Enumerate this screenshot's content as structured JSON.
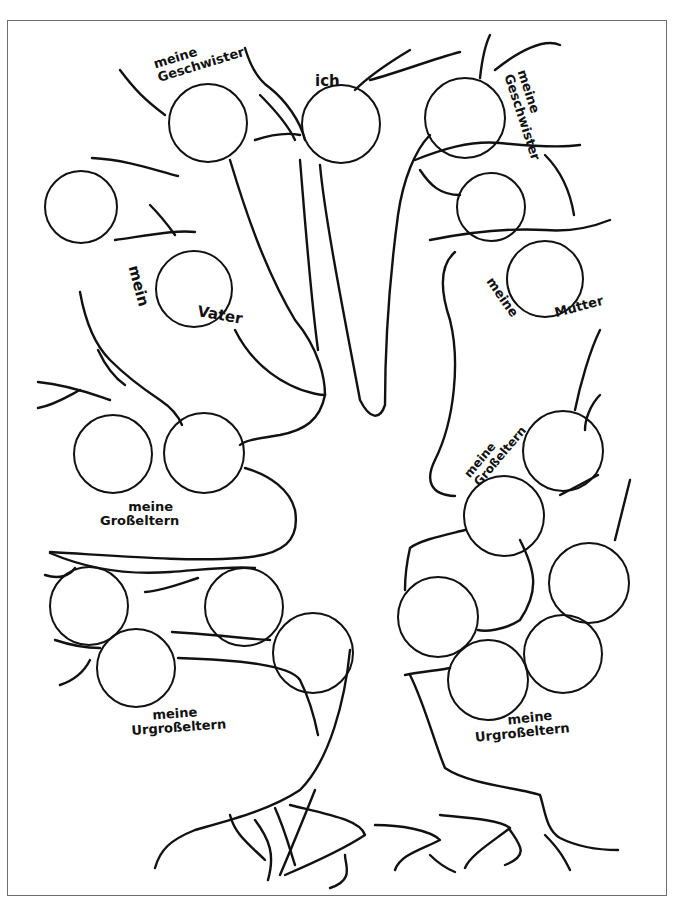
{
  "worksheet": {
    "title": "Stammbaum",
    "colors": {
      "line": "#111111",
      "frame": "#6e6e6e",
      "background": "#ffffff"
    }
  },
  "labels": {
    "siblings_left": {
      "line1": "meine",
      "line2": "Geschwister"
    },
    "me": {
      "line1": "ich"
    },
    "siblings_right": {
      "line1": "meine",
      "line2": "Geschwister"
    },
    "father": {
      "line1": "mein",
      "line2": "Vater"
    },
    "mother": {
      "line1": "meine",
      "line2": "Mutter"
    },
    "grandparents_left": {
      "line1": "meine",
      "line2": "Großeltern"
    },
    "grandparents_right": {
      "line1": "meine",
      "line2": "Großeltern"
    },
    "great_grandparents_left": {
      "line1": "meine",
      "line2": "Urgroßeltern"
    },
    "great_grandparents_right": {
      "line1": "meine",
      "line2": "Urgroßeltern"
    }
  },
  "slots": [
    {
      "id": "sibling-left-1",
      "group": "siblings_left",
      "cx": 208,
      "cy": 123,
      "r": 40
    },
    {
      "id": "sibling-left-2",
      "group": "siblings_left",
      "cx": 81,
      "cy": 207,
      "r": 37
    },
    {
      "id": "me",
      "group": "me",
      "cx": 341,
      "cy": 124,
      "r": 40
    },
    {
      "id": "sibling-right-1",
      "group": "siblings_right",
      "cx": 465,
      "cy": 118,
      "r": 41
    },
    {
      "id": "sibling-right-2",
      "group": "siblings_right",
      "cx": 491,
      "cy": 207,
      "r": 35
    },
    {
      "id": "father",
      "group": "father",
      "cx": 194,
      "cy": 289,
      "r": 39
    },
    {
      "id": "mother",
      "group": "mother",
      "cx": 545,
      "cy": 279,
      "r": 39
    },
    {
      "id": "grandparent-left-1",
      "group": "grandparents_left",
      "cx": 113,
      "cy": 454,
      "r": 40
    },
    {
      "id": "grandparent-left-2",
      "group": "grandparents_left",
      "cx": 204,
      "cy": 453,
      "r": 41
    },
    {
      "id": "grandparent-right-1",
      "group": "grandparents_right",
      "cx": 563,
      "cy": 451,
      "r": 41
    },
    {
      "id": "grandparent-right-2",
      "group": "grandparents_right",
      "cx": 504,
      "cy": 516,
      "r": 41
    },
    {
      "id": "great-grandparent-left-1",
      "group": "great_grandparents_left",
      "cx": 89,
      "cy": 606,
      "r": 40
    },
    {
      "id": "great-grandparent-left-2",
      "group": "great_grandparents_left",
      "cx": 244,
      "cy": 607,
      "r": 40
    },
    {
      "id": "great-grandparent-left-3",
      "group": "great_grandparents_left",
      "cx": 136,
      "cy": 668,
      "r": 40
    },
    {
      "id": "great-grandparent-left-4",
      "group": "great_grandparents_left",
      "cx": 313,
      "cy": 653,
      "r": 41
    },
    {
      "id": "great-grandparent-right-1",
      "group": "great_grandparents_right",
      "cx": 438,
      "cy": 617,
      "r": 41
    },
    {
      "id": "great-grandparent-right-2",
      "group": "great_grandparents_right",
      "cx": 589,
      "cy": 583,
      "r": 41
    },
    {
      "id": "great-grandparent-right-3",
      "group": "great_grandparents_right",
      "cx": 563,
      "cy": 654,
      "r": 40
    },
    {
      "id": "great-grandparent-right-4",
      "group": "great_grandparents_right",
      "cx": 488,
      "cy": 680,
      "r": 41
    }
  ]
}
